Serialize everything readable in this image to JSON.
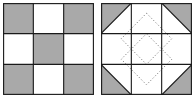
{
  "figure": {
    "colors": {
      "shaded": "#a9a9a9",
      "background": "#ffffff",
      "line": "#1a1a1a",
      "dotted": "#777777"
    },
    "left_block": {
      "name": "nine-patch",
      "grid": 3,
      "cells": [
        [
          "shaded",
          "white",
          "shaded"
        ],
        [
          "white",
          "shaded",
          "white"
        ],
        [
          "shaded",
          "white",
          "shaded"
        ]
      ]
    },
    "right_block": {
      "name": "corner-triangle block",
      "grid": 3,
      "corner_triangles": [
        "top-left",
        "top-right",
        "bottom-left",
        "bottom-right"
      ],
      "quilting": "two overlapping dotted diamonds in center"
    }
  }
}
